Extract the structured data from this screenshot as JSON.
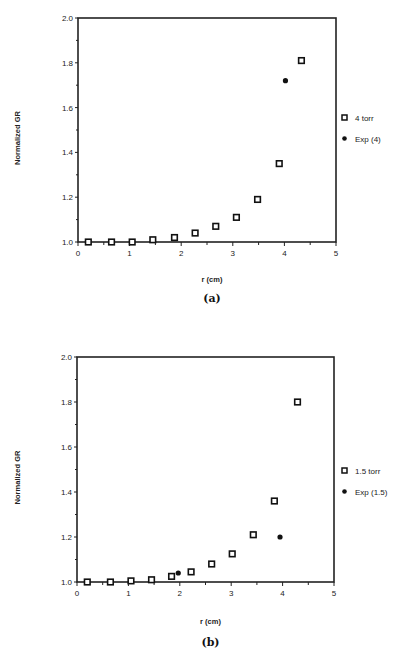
{
  "chart_data": [
    {
      "type": "scatter",
      "panel_label": "(a)",
      "title": "",
      "xlabel": "r   (cm)",
      "ylabel": "Normalized   GR",
      "xlim": [
        0,
        5
      ],
      "ylim": [
        1.0,
        2.0
      ],
      "xticks": [
        "0",
        "1",
        "2",
        "3",
        "4",
        "5"
      ],
      "yticks": [
        "1.0",
        "1.2",
        "1.4",
        "1.6",
        "1.8",
        "2.0"
      ],
      "grid": false,
      "legend_position": "right",
      "series": [
        {
          "name": "4 torr",
          "marker": "square",
          "x": [
            0.2,
            0.65,
            1.05,
            1.45,
            1.87,
            2.27,
            2.67,
            3.07,
            3.48,
            3.9,
            4.33
          ],
          "y": [
            1.0,
            1.0,
            1.0,
            1.01,
            1.02,
            1.04,
            1.07,
            1.11,
            1.19,
            1.35,
            1.81
          ]
        },
        {
          "name": "Exp (4)",
          "marker": "circle",
          "x": [
            4.02
          ],
          "y": [
            1.72
          ]
        }
      ]
    },
    {
      "type": "scatter",
      "panel_label": "(b)",
      "title": "",
      "xlabel": "r   (cm)",
      "ylabel": "Normalized   GR",
      "xlim": [
        0,
        5
      ],
      "ylim": [
        1.0,
        2.0
      ],
      "xticks": [
        "0",
        "1",
        "2",
        "3",
        "4",
        "5"
      ],
      "yticks": [
        "1.0",
        "1.2",
        "1.4",
        "1.6",
        "1.8",
        "2.0"
      ],
      "grid": false,
      "legend_position": "right",
      "series": [
        {
          "name": "1.5 torr",
          "marker": "square",
          "x": [
            0.2,
            0.65,
            1.05,
            1.45,
            1.84,
            2.22,
            2.62,
            3.02,
            3.43,
            3.84,
            4.29
          ],
          "y": [
            1.0,
            1.0,
            1.005,
            1.01,
            1.025,
            1.045,
            1.08,
            1.125,
            1.21,
            1.36,
            1.8
          ]
        },
        {
          "name": "Exp (1.5)",
          "marker": "circle",
          "x": [
            1.97,
            3.95
          ],
          "y": [
            1.04,
            1.2
          ]
        }
      ]
    }
  ]
}
